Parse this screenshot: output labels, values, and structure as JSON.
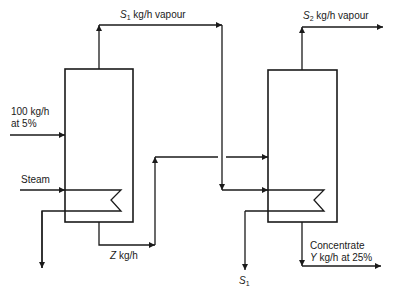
{
  "diagram": {
    "labels": {
      "s1_vapour": {
        "symbol": "S",
        "sub": "1",
        "text": " kg/h vapour"
      },
      "s2_vapour": {
        "symbol": "S",
        "sub": "2",
        "text": " kg/h vapour"
      },
      "feed_line1": "100 kg/h",
      "feed_line2": "at 5%",
      "steam": "Steam",
      "z_flow": {
        "symbol": "Z",
        "text": " kg/h"
      },
      "concentrate_line1": "Concentrate",
      "concentrate_line2": {
        "symbol": "Y",
        "text": " kg/h at 25%"
      },
      "s1_condensate": {
        "symbol": "S",
        "sub": "1"
      }
    },
    "units": [
      {
        "name": "first-effect",
        "x": 65,
        "y": 69,
        "w": 68,
        "h": 153
      },
      {
        "name": "second-effect",
        "x": 268,
        "y": 70,
        "w": 69,
        "h": 152
      }
    ],
    "colors": {
      "line": "#1a1a1a",
      "background": "#ffffff"
    }
  }
}
